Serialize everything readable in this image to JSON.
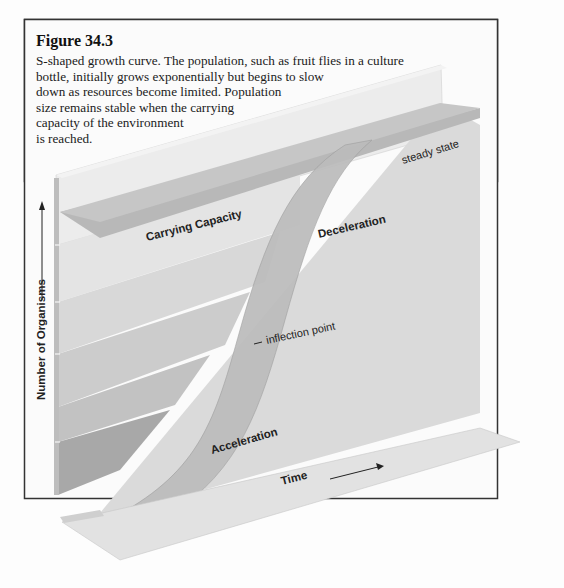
{
  "figure": {
    "title": "Figure 34.3",
    "caption_lines": [
      "S-shaped growth curve. The population, such as fruit flies in a culture",
      "bottle, initially grows exponentially but begins to slow",
      "down as resources become limited. Population",
      "size remains stable when the carrying",
      "capacity of the environment",
      "is reached."
    ]
  },
  "diagram": {
    "y_axis_label": "Number of Organisms",
    "x_axis_label": "Time",
    "labels": {
      "carrying_capacity": "Carrying Capacity",
      "deceleration": "Deceleration",
      "steady_state": "steady state",
      "inflection_point": "inflection point",
      "acceleration": "Acceleration"
    },
    "phases": [
      "Acceleration",
      "inflection point",
      "Deceleration",
      "steady state"
    ],
    "colors": {
      "panel_light": "#e6e6e6",
      "panel_mid": "#cfcfcf",
      "panel_dark": "#a9a9a9",
      "curve_ribbon": "#bdbdbd",
      "border": "#333333",
      "text": "#222222"
    }
  }
}
